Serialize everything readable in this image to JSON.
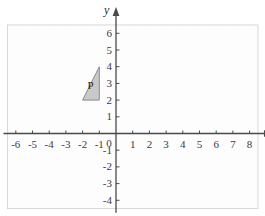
{
  "figure": {
    "type": "coordinate-grid-diagram",
    "background_color": "#ffffff",
    "grid_color": "#d8d8dc",
    "grid_border_color": "#cfcfd4",
    "axis_color": "#4a4a4a",
    "label_color": "#3b3b3b"
  },
  "axes": {
    "x": {
      "name": "x",
      "min": -6.5,
      "max": 8.5,
      "tick_labels": [
        "-6",
        "-5",
        "-4",
        "-3",
        "-2",
        "-1",
        "1",
        "2",
        "3",
        "4",
        "5",
        "6",
        "7",
        "8"
      ],
      "tick_values": [
        -6,
        -5,
        -4,
        -3,
        -2,
        -1,
        1,
        2,
        3,
        4,
        5,
        6,
        7,
        8
      ],
      "arrow": "right"
    },
    "y": {
      "name": "y",
      "min": -4.5,
      "max": 6.5,
      "tick_labels": [
        "6",
        "5",
        "4",
        "3",
        "2",
        "1",
        "-1",
        "-2",
        "-3",
        "-4"
      ],
      "tick_values": [
        6,
        5,
        4,
        3,
        2,
        1,
        -1,
        -2,
        -3,
        -4
      ],
      "arrow": "up"
    },
    "origin_label": "0"
  },
  "shapes": [
    {
      "label": "P",
      "type": "triangle",
      "vertices": [
        [
          -1,
          4
        ],
        [
          -1,
          2
        ],
        [
          -2,
          2
        ]
      ],
      "fill_color": "#c9c9c9",
      "stroke_color": "#8a8a8a",
      "label_position": [
        -1.35,
        2.85
      ]
    }
  ]
}
